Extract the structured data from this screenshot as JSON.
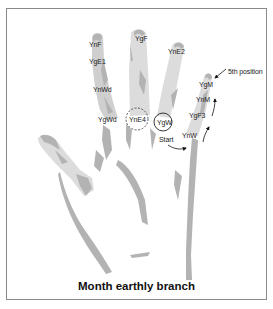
{
  "title": "Month earthly branch",
  "colors": {
    "hand_shading": "#b3b3b3",
    "frame": "#8a8a8a",
    "text": "#222222",
    "background": "#ffffff"
  },
  "fingers": {
    "index": {
      "labels": [
        {
          "text": "YnF",
          "x": 89,
          "y": 41
        },
        {
          "text": "YgE1",
          "x": 89,
          "y": 58
        },
        {
          "text": "YnWd",
          "x": 93,
          "y": 86
        },
        {
          "text": "YgWd",
          "x": 98,
          "y": 116
        }
      ]
    },
    "middle": {
      "labels": [
        {
          "text": "YgF",
          "x": 135,
          "y": 35
        },
        {
          "text": "YnE4",
          "x": 129,
          "y": 116
        }
      ]
    },
    "ring": {
      "labels": [
        {
          "text": "YnE2",
          "x": 168,
          "y": 48
        },
        {
          "text": "YgW",
          "x": 157,
          "y": 119
        }
      ]
    },
    "little": {
      "labels": [
        {
          "text": "YgM",
          "x": 199,
          "y": 81
        },
        {
          "text": "YnM",
          "x": 196,
          "y": 96
        },
        {
          "text": "YgF3",
          "x": 189,
          "y": 112
        },
        {
          "text": "YnW",
          "x": 182,
          "y": 132
        }
      ]
    }
  },
  "annotations": {
    "fifth_position": {
      "text": "5th position",
      "x": 228,
      "y": 68
    },
    "start": {
      "text": "Start",
      "x": 159,
      "y": 136
    }
  },
  "markers": {
    "dashed_circle": {
      "label": "YnE4",
      "cx": 137,
      "cy": 119,
      "r": 11
    },
    "solid_circle": {
      "label": "YgW",
      "cx": 163,
      "cy": 122,
      "r": 9
    }
  }
}
